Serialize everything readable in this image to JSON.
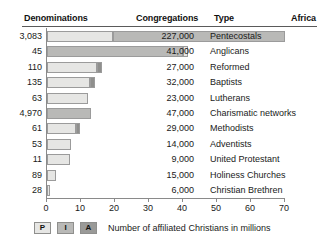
{
  "headers": {
    "denominations": "Denominations",
    "congregations": "Congregations",
    "type": "Type",
    "region": "Africa"
  },
  "legend": {
    "items": [
      {
        "key": "P",
        "label": "P",
        "color": "#e6e6e4"
      },
      {
        "key": "I",
        "label": "I",
        "color": "#b9b9b7"
      },
      {
        "key": "A",
        "label": "A",
        "color": "#9a9a98"
      }
    ],
    "caption": "Number of affiliated Christians in millions"
  },
  "chart_data": {
    "type": "bar",
    "title": "",
    "xlabel": "Number of affiliated Christians in millions",
    "ylabel": "",
    "xlim": [
      0,
      75
    ],
    "xticks": [
      0,
      10,
      20,
      30,
      40,
      50,
      60,
      70
    ],
    "grid": false,
    "orientation": "horizontal",
    "legend_position": "bottom-left",
    "series": [
      {
        "name": "P",
        "color": "#e6e6e4"
      },
      {
        "name": "I",
        "color": "#b9b9b7"
      },
      {
        "name": "A",
        "color": "#8f8f8d"
      }
    ],
    "categories": [
      "Pentecostals",
      "Anglicans",
      "Reformed",
      "Baptists",
      "Lutherans",
      "Charismatic networks",
      "Methodists",
      "Adventists",
      "United Protestant",
      "Holiness Churches",
      "Christian Brethren"
    ],
    "rows": [
      {
        "denominations": "3,083",
        "congregations": "227,000",
        "type": "Pentecostals",
        "total": 70.0,
        "segments": [
          {
            "series": "P",
            "value": 19.5
          },
          {
            "series": "I",
            "value": 50.5
          }
        ]
      },
      {
        "denominations": "45",
        "congregations": "41,000",
        "type": "Anglicans",
        "total": 41.5,
        "segments": [
          {
            "series": "I",
            "value": 40.0
          },
          {
            "series": "P",
            "value": 1.5
          }
        ]
      },
      {
        "denominations": "110",
        "congregations": "27,000",
        "type": "Reformed",
        "total": 16.2,
        "segments": [
          {
            "series": "P",
            "value": 14.7
          },
          {
            "series": "A",
            "value": 1.5
          }
        ]
      },
      {
        "denominations": "135",
        "congregations": "32,000",
        "type": "Baptists",
        "total": 14.0,
        "segments": [
          {
            "series": "P",
            "value": 12.7
          },
          {
            "series": "A",
            "value": 1.3
          }
        ]
      },
      {
        "denominations": "63",
        "congregations": "23,000",
        "type": "Lutherans",
        "total": 12.0,
        "segments": [
          {
            "series": "P",
            "value": 12.0
          }
        ]
      },
      {
        "denominations": "4,970",
        "congregations": "47,000",
        "type": "Charismatic networks",
        "total": 12.8,
        "segments": [
          {
            "series": "I",
            "value": 12.8
          }
        ]
      },
      {
        "denominations": "61",
        "congregations": "29,000",
        "type": "Methodists",
        "total": 9.6,
        "segments": [
          {
            "series": "P",
            "value": 8.4
          },
          {
            "series": "A",
            "value": 1.2
          }
        ]
      },
      {
        "denominations": "53",
        "congregations": "14,000",
        "type": "Adventists",
        "total": 7.2,
        "segments": [
          {
            "series": "P",
            "value": 7.2
          }
        ]
      },
      {
        "denominations": "11",
        "congregations": "9,000",
        "type": "United Protestant",
        "total": 6.8,
        "segments": [
          {
            "series": "P",
            "value": 6.8
          }
        ]
      },
      {
        "denominations": "89",
        "congregations": "15,000",
        "type": "Holiness Churches",
        "total": 2.5,
        "segments": [
          {
            "series": "P",
            "value": 2.5
          }
        ]
      },
      {
        "denominations": "28",
        "congregations": "6,000",
        "type": "Christian Brethren",
        "total": 1.0,
        "segments": [
          {
            "series": "P",
            "value": 1.0
          }
        ]
      }
    ]
  }
}
